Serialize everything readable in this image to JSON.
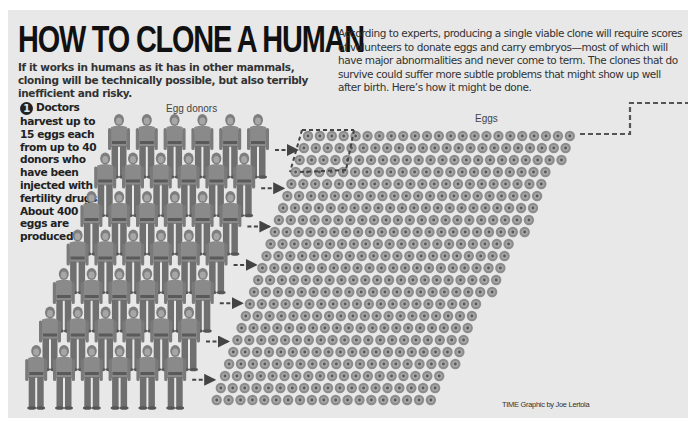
{
  "headline": "HOW TO CLONE A HUMAN",
  "deck": "If it works in humans as it has in other mammals, cloning will be technically possible, but also terribly inefficient and risky.",
  "intro": "According to experts, producing a single viable clone will require scores of volunteers to donate eggs and carry embryos—most of which will have major abnormalities and never come to term. The clones that do survive could suffer more subtle problems that might show up well after birth. Here’s how it might be done.",
  "step1": {
    "number": "1",
    "text": "Doctors harvest up to 15 eggs each from up to 40 donors who have been injected with fertility drugs. About 400 eggs are produced"
  },
  "labels": {
    "donors": "Egg donors",
    "eggs": "Eggs"
  },
  "credit": "TIME Graphic by Joe Lertola",
  "figure": {
    "donor_rows": 7,
    "donors_per_row": 6,
    "egg_rows": 23,
    "eggs_per_row": 23,
    "colors": {
      "panel": "#e8e8e8",
      "figure": "#8a8a8a",
      "egg_outer": "#8c8c8c",
      "egg_inner": "#5e5e5e",
      "dash": "#555555"
    }
  }
}
